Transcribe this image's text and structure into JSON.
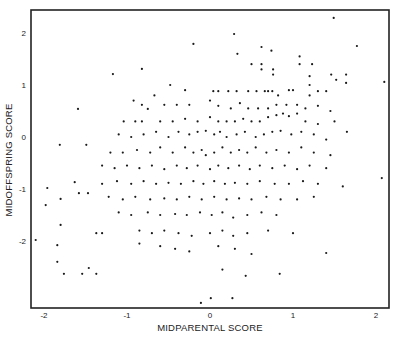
{
  "chart_data": {
    "type": "scatter",
    "title": "",
    "xlabel": "MIDPARENTAL SCORE",
    "ylabel": "MIDOFFSPRING SCORE",
    "xlim": [
      -2.2,
      2.15
    ],
    "ylim": [
      -3.3,
      2.45
    ],
    "xticks": [
      -2,
      -1,
      0,
      1,
      2
    ],
    "yticks": [
      -2,
      -1,
      0,
      1,
      2
    ],
    "xtick_labels": [
      "-2",
      "-1",
      "0",
      "1",
      "2"
    ],
    "ytick_labels": [
      "-2",
      "-1",
      "0",
      "1",
      "2"
    ],
    "grid": false,
    "legend": null,
    "marker_color": "#1a1a1a",
    "points": [
      [
        -1.81,
        -0.15
      ],
      [
        -1.49,
        -0.15
      ],
      [
        -1.59,
        0.54
      ],
      [
        -2.1,
        -1.98
      ],
      [
        -1.96,
        -0.98
      ],
      [
        -1.98,
        -1.31
      ],
      [
        -1.84,
        -2.08
      ],
      [
        -1.84,
        -2.4
      ],
      [
        -1.76,
        -2.63
      ],
      [
        -1.54,
        -2.63
      ],
      [
        -1.37,
        -2.63
      ],
      [
        -1.46,
        -2.52
      ],
      [
        -1.8,
        -1.69
      ],
      [
        -1.37,
        -1.85
      ],
      [
        -1.63,
        -0.87
      ],
      [
        -1.58,
        -1.08
      ],
      [
        -1.47,
        -1.08
      ],
      [
        -1.8,
        -1.19
      ],
      [
        0.29,
        1.98
      ],
      [
        1.49,
        2.29
      ],
      [
        1.77,
        1.75
      ],
      [
        -0.82,
        1.31
      ],
      [
        -0.2,
        1.79
      ],
      [
        -1.17,
        1.21
      ],
      [
        -0.75,
        0.54
      ],
      [
        2.1,
        1.06
      ],
      [
        -0.11,
        -3.19
      ],
      [
        0.01,
        -3.1
      ],
      [
        0.27,
        -3.1
      ],
      [
        0.43,
        -2.67
      ],
      [
        0.84,
        -2.63
      ],
      [
        2.07,
        -0.79
      ],
      [
        1.4,
        -2.23
      ],
      [
        0.33,
        1.6
      ],
      [
        0.62,
        1.73
      ],
      [
        0.74,
        1.66
      ],
      [
        0.5,
        1.4
      ],
      [
        0.62,
        1.4
      ],
      [
        0.62,
        1.3
      ],
      [
        0.76,
        1.3
      ],
      [
        0.76,
        1.2
      ],
      [
        1.08,
        1.55
      ],
      [
        1.08,
        1.4
      ],
      [
        1.23,
        1.4
      ],
      [
        1.2,
        1.17
      ],
      [
        1.2,
        1.0
      ],
      [
        1.46,
        1.2
      ],
      [
        1.64,
        1.2
      ],
      [
        1.52,
        1.1
      ],
      [
        1.64,
        1.04
      ],
      [
        -0.48,
        1.0
      ],
      [
        -0.67,
        0.8
      ],
      [
        -0.3,
        0.9
      ],
      [
        0.04,
        0.88
      ],
      [
        0.1,
        0.88
      ],
      [
        0.22,
        0.88
      ],
      [
        0.32,
        0.88
      ],
      [
        0.46,
        0.88
      ],
      [
        0.56,
        0.88
      ],
      [
        0.66,
        0.88
      ],
      [
        0.7,
        0.88
      ],
      [
        0.75,
        0.88
      ],
      [
        0.82,
        0.8
      ],
      [
        0.95,
        0.9
      ],
      [
        1.0,
        0.9
      ],
      [
        1.2,
        0.8
      ],
      [
        1.3,
        0.88
      ],
      [
        1.4,
        0.88
      ],
      [
        -0.92,
        0.7
      ],
      [
        -0.82,
        0.62
      ],
      [
        -0.55,
        0.62
      ],
      [
        -0.4,
        0.62
      ],
      [
        -0.25,
        0.62
      ],
      [
        0.0,
        0.7
      ],
      [
        0.1,
        0.6
      ],
      [
        0.25,
        0.55
      ],
      [
        0.36,
        0.65
      ],
      [
        0.46,
        0.55
      ],
      [
        0.58,
        0.55
      ],
      [
        0.7,
        0.55
      ],
      [
        0.8,
        0.62
      ],
      [
        0.92,
        0.62
      ],
      [
        1.05,
        0.62
      ],
      [
        1.15,
        0.55
      ],
      [
        1.3,
        0.6
      ],
      [
        1.45,
        0.5
      ],
      [
        -1.04,
        0.3
      ],
      [
        -0.9,
        0.3
      ],
      [
        -0.82,
        0.3
      ],
      [
        -0.6,
        0.3
      ],
      [
        -0.45,
        0.3
      ],
      [
        -0.3,
        0.35
      ],
      [
        -0.15,
        0.3
      ],
      [
        0.0,
        0.38
      ],
      [
        0.1,
        0.3
      ],
      [
        0.2,
        0.3
      ],
      [
        0.3,
        0.3
      ],
      [
        0.4,
        0.35
      ],
      [
        0.5,
        0.3
      ],
      [
        0.6,
        0.3
      ],
      [
        0.7,
        0.38
      ],
      [
        0.8,
        0.42
      ],
      [
        0.88,
        0.45
      ],
      [
        0.95,
        0.4
      ],
      [
        1.05,
        0.45
      ],
      [
        1.15,
        0.3
      ],
      [
        1.3,
        0.25
      ],
      [
        1.5,
        0.3
      ],
      [
        -1.1,
        0.05
      ],
      [
        -0.95,
        0.0
      ],
      [
        -0.8,
        0.05
      ],
      [
        -0.65,
        0.1
      ],
      [
        -0.5,
        0.0
      ],
      [
        -0.38,
        0.1
      ],
      [
        -0.25,
        0.05
      ],
      [
        -0.15,
        0.1
      ],
      [
        -0.05,
        0.12
      ],
      [
        0.05,
        0.05
      ],
      [
        0.12,
        0.1
      ],
      [
        0.2,
        0.0
      ],
      [
        0.32,
        0.05
      ],
      [
        0.42,
        0.1
      ],
      [
        0.55,
        0.0
      ],
      [
        0.65,
        0.05
      ],
      [
        0.75,
        0.1
      ],
      [
        0.85,
        0.12
      ],
      [
        0.98,
        0.05
      ],
      [
        1.1,
        0.1
      ],
      [
        1.25,
        0.05
      ],
      [
        1.4,
        -0.05
      ],
      [
        1.65,
        0.1
      ],
      [
        -1.2,
        -0.3
      ],
      [
        -1.05,
        -0.3
      ],
      [
        -0.88,
        -0.25
      ],
      [
        -0.72,
        -0.3
      ],
      [
        -0.6,
        -0.2
      ],
      [
        -0.45,
        -0.3
      ],
      [
        -0.3,
        -0.2
      ],
      [
        -0.2,
        -0.3
      ],
      [
        -0.1,
        -0.25
      ],
      [
        -0.05,
        -0.35
      ],
      [
        0.05,
        -0.3
      ],
      [
        0.15,
        -0.2
      ],
      [
        0.25,
        -0.3
      ],
      [
        0.35,
        -0.25
      ],
      [
        0.45,
        -0.3
      ],
      [
        0.55,
        -0.2
      ],
      [
        0.68,
        -0.3
      ],
      [
        0.8,
        -0.25
      ],
      [
        0.95,
        -0.3
      ],
      [
        1.1,
        -0.2
      ],
      [
        1.25,
        -0.3
      ],
      [
        1.45,
        -0.35
      ],
      [
        -1.3,
        -0.55
      ],
      [
        -1.15,
        -0.6
      ],
      [
        -1.0,
        -0.55
      ],
      [
        -0.85,
        -0.6
      ],
      [
        -0.7,
        -0.55
      ],
      [
        -0.55,
        -0.62
      ],
      [
        -0.4,
        -0.55
      ],
      [
        -0.28,
        -0.6
      ],
      [
        -0.15,
        -0.55
      ],
      [
        0.0,
        -0.62
      ],
      [
        0.1,
        -0.55
      ],
      [
        0.22,
        -0.6
      ],
      [
        0.35,
        -0.55
      ],
      [
        0.48,
        -0.62
      ],
      [
        0.6,
        -0.55
      ],
      [
        0.75,
        -0.6
      ],
      [
        0.9,
        -0.55
      ],
      [
        1.05,
        -0.62
      ],
      [
        1.2,
        -0.55
      ],
      [
        1.4,
        -0.6
      ],
      [
        -1.3,
        -0.9
      ],
      [
        -1.12,
        -0.85
      ],
      [
        -0.95,
        -0.9
      ],
      [
        -0.8,
        -0.85
      ],
      [
        -0.65,
        -0.9
      ],
      [
        -0.5,
        -0.88
      ],
      [
        -0.35,
        -0.9
      ],
      [
        -0.2,
        -0.85
      ],
      [
        -0.08,
        -0.9
      ],
      [
        0.05,
        -0.85
      ],
      [
        0.18,
        -0.9
      ],
      [
        0.3,
        -0.88
      ],
      [
        0.45,
        -0.9
      ],
      [
        0.6,
        -0.85
      ],
      [
        0.78,
        -0.9
      ],
      [
        0.95,
        -0.9
      ],
      [
        1.12,
        -0.85
      ],
      [
        1.3,
        -0.9
      ],
      [
        1.6,
        -0.95
      ],
      [
        -1.22,
        -1.15
      ],
      [
        -1.05,
        -1.2
      ],
      [
        -0.9,
        -1.15
      ],
      [
        -0.72,
        -1.2
      ],
      [
        -0.55,
        -1.18
      ],
      [
        -0.4,
        -1.2
      ],
      [
        -0.25,
        -1.15
      ],
      [
        -0.1,
        -1.2
      ],
      [
        0.05,
        -1.15
      ],
      [
        0.2,
        -1.2
      ],
      [
        0.35,
        -1.18
      ],
      [
        0.5,
        -1.2
      ],
      [
        0.68,
        -1.15
      ],
      [
        0.85,
        -1.2
      ],
      [
        1.05,
        -1.2
      ],
      [
        1.25,
        -1.15
      ],
      [
        -1.1,
        -1.45
      ],
      [
        -0.95,
        -1.5
      ],
      [
        -0.75,
        -1.45
      ],
      [
        -0.6,
        -1.5
      ],
      [
        -0.42,
        -1.48
      ],
      [
        -0.28,
        -1.5
      ],
      [
        -0.12,
        -1.45
      ],
      [
        0.02,
        -1.5
      ],
      [
        0.15,
        -1.45
      ],
      [
        0.28,
        -1.55
      ],
      [
        0.45,
        -1.5
      ],
      [
        0.62,
        -1.45
      ],
      [
        0.8,
        -1.5
      ],
      [
        -1.3,
        -1.85
      ],
      [
        -0.85,
        -1.8
      ],
      [
        -0.7,
        -1.85
      ],
      [
        -0.55,
        -1.8
      ],
      [
        -0.38,
        -1.85
      ],
      [
        -0.22,
        -1.9
      ],
      [
        0.0,
        -1.85
      ],
      [
        0.15,
        -1.8
      ],
      [
        0.28,
        -1.9
      ],
      [
        0.45,
        -1.85
      ],
      [
        0.7,
        -1.8
      ],
      [
        1.0,
        -1.85
      ],
      [
        -0.85,
        -2.05
      ],
      [
        -0.6,
        -2.1
      ],
      [
        -0.42,
        -2.15
      ],
      [
        -0.25,
        -2.2
      ],
      [
        0.1,
        -2.1
      ],
      [
        0.3,
        -2.15
      ],
      [
        0.5,
        -2.25
      ],
      [
        0.15,
        -2.55
      ]
    ]
  },
  "axes": {
    "x_title": "MIDPARENTAL SCORE",
    "y_title": "MIDOFFSPRING SCORE"
  }
}
